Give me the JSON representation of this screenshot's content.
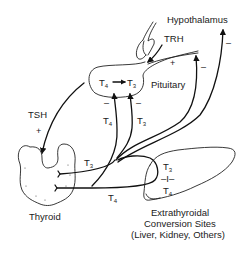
{
  "diagram": {
    "labels": {
      "hypothalamus": "Hypothalamus",
      "trh": "TRH",
      "pituitary": "Pituitary",
      "tsh": "TSH",
      "thyroid": "Thyroid",
      "extrathyroidal_line1": "Extrathyroidal",
      "extrathyroidal_line2": "Conversion Sites",
      "extrathyroidal_line3": "(Liver, Kidney, Others)"
    },
    "hormones": {
      "t4": {
        "base": "T",
        "sub": "4"
      },
      "t3": {
        "base": "T",
        "sub": "3"
      }
    },
    "signs": {
      "plus": "+",
      "minus": "–",
      "conversion": "–I–"
    },
    "nodes": [
      {
        "id": "hypothalamus",
        "label": "Hypothalamus"
      },
      {
        "id": "pituitary",
        "label": "Pituitary",
        "contains": "T4 → T3"
      },
      {
        "id": "thyroid",
        "label": "Thyroid"
      },
      {
        "id": "extrathyroidal",
        "label": "Extrathyroidal Conversion Sites (Liver, Kidney, Others)",
        "contains": "T3 –I– T4"
      }
    ],
    "edges": [
      {
        "from": "hypothalamus",
        "to": "pituitary",
        "label": "TRH",
        "sign": "+"
      },
      {
        "from": "pituitary",
        "to": "thyroid",
        "label": "TSH",
        "sign": "+"
      },
      {
        "from": "thyroid",
        "to": "pituitary",
        "label": "T4",
        "sign": "–"
      },
      {
        "from": "thyroid",
        "to": "pituitary",
        "label": "T3",
        "sign": "–"
      },
      {
        "from": "thyroid",
        "to": "extrathyroidal",
        "label": "T3"
      },
      {
        "from": "thyroid",
        "to": "extrathyroidal",
        "label": "T4"
      },
      {
        "from": "extrathyroidal",
        "to": "hypothalamus",
        "sign": "–"
      },
      {
        "from": "extrathyroidal",
        "to": "pituitary",
        "sign": "–"
      }
    ]
  }
}
